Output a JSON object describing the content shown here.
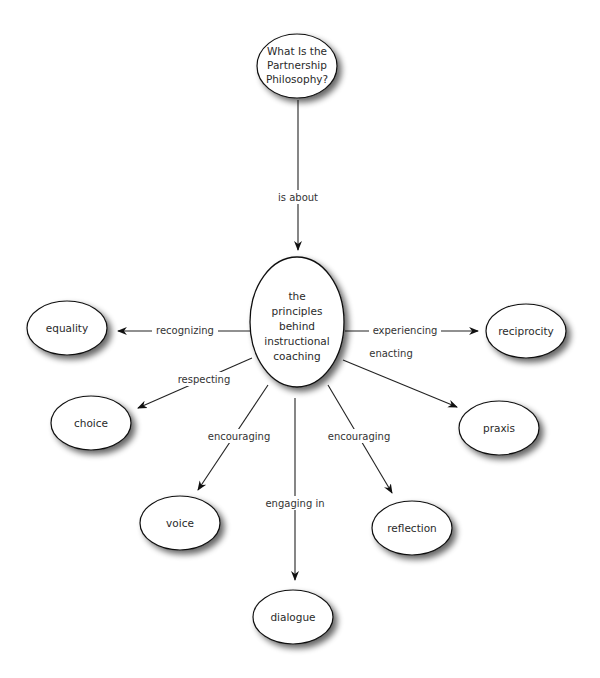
{
  "diagram": {
    "type": "concept-map",
    "root": {
      "id": "q",
      "lines": [
        "What Is the",
        "Partnership",
        "Philosophy?"
      ]
    },
    "center": {
      "id": "c",
      "lines": [
        "the",
        "principles",
        "behind",
        "instructional",
        "coaching"
      ]
    },
    "root_edge": {
      "label": "is about"
    },
    "nodes": [
      {
        "id": "equality",
        "label": "equality"
      },
      {
        "id": "choice",
        "label": "choice"
      },
      {
        "id": "voice",
        "label": "voice"
      },
      {
        "id": "dialogue",
        "label": "dialogue"
      },
      {
        "id": "reflection",
        "label": "reflection"
      },
      {
        "id": "praxis",
        "label": "praxis"
      },
      {
        "id": "reciprocity",
        "label": "reciprocity"
      }
    ],
    "edges": [
      {
        "from": "c",
        "to": "equality",
        "label": "recognizing"
      },
      {
        "from": "c",
        "to": "choice",
        "label": "respecting"
      },
      {
        "from": "c",
        "to": "voice",
        "label": "encouraging"
      },
      {
        "from": "c",
        "to": "dialogue",
        "label": "engaging in"
      },
      {
        "from": "c",
        "to": "reflection",
        "label": "encouraging"
      },
      {
        "from": "c",
        "to": "praxis",
        "label": "enacting"
      },
      {
        "from": "c",
        "to": "reciprocity",
        "label": "experiencing"
      }
    ]
  }
}
